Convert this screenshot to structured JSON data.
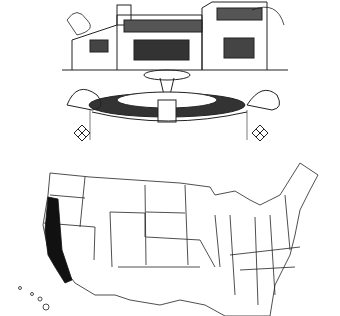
{
  "figure": {
    "illustration": {
      "subject": "house with courtyard fountain",
      "style": "pen-and-ink line drawing"
    },
    "map": {
      "subject": "United States outline map",
      "highlighted_region": "California (central valley & coastal region)",
      "highlight_color": "#111111",
      "line_color": "#222222",
      "background_color": "#ffffff"
    }
  }
}
